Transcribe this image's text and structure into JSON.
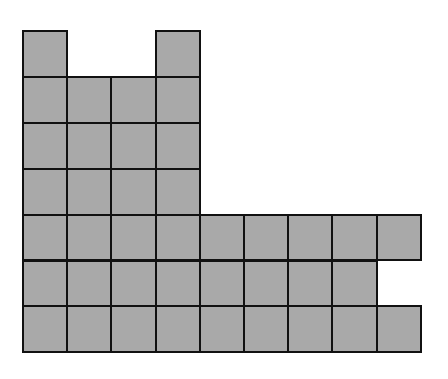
{
  "figure": {
    "fill_color": "#a9a9a9",
    "border_color": "#111111",
    "columns": 9,
    "rows": 7,
    "origin_x": 23,
    "origin_y": 31,
    "cell_width": 44.2,
    "cell_height": 45.9,
    "filled_rows": [
      [
        1,
        0,
        0,
        1,
        0,
        0,
        0,
        0,
        0
      ],
      [
        1,
        1,
        1,
        1,
        0,
        0,
        0,
        0,
        0
      ],
      [
        1,
        1,
        1,
        1,
        0,
        0,
        0,
        0,
        0
      ],
      [
        1,
        1,
        1,
        1,
        0,
        0,
        0,
        0,
        0
      ],
      [
        1,
        1,
        1,
        1,
        1,
        1,
        1,
        1,
        1
      ],
      [
        1,
        1,
        1,
        1,
        1,
        1,
        1,
        1,
        0
      ],
      [
        1,
        1,
        1,
        1,
        1,
        1,
        1,
        1,
        1
      ]
    ],
    "total_squares": 44
  }
}
